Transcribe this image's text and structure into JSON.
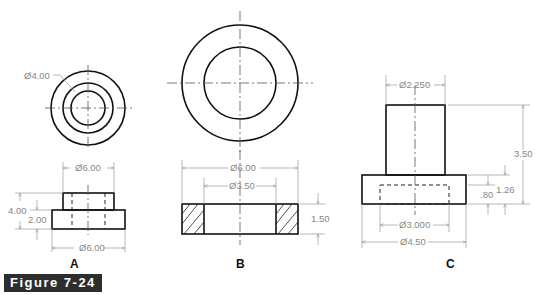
{
  "figure": {
    "caption": "Figure 7-24",
    "badge_color": "#2d2d2d"
  },
  "views": {
    "A": {
      "label": "A",
      "top_view_callout": "Ø4.00",
      "dims": {
        "top_width": "Ø6.00",
        "bottom_width": "Ø6.00",
        "overall_height": "4.00",
        "base_height": "2.00"
      }
    },
    "B": {
      "label": "B",
      "dims": {
        "outer_diameter": "Ø6.00",
        "inner_diameter": "Ø3.50",
        "thickness": "1.50"
      }
    },
    "C": {
      "label": "C",
      "dims": {
        "shaft_diameter": "Ø2.250",
        "overall_height": "3.50",
        "flange_height": "1.26",
        "counterbore_depth": ".80",
        "counterbore_diameter": "Ø3.000",
        "flange_diameter": "Ø4.50"
      }
    }
  }
}
